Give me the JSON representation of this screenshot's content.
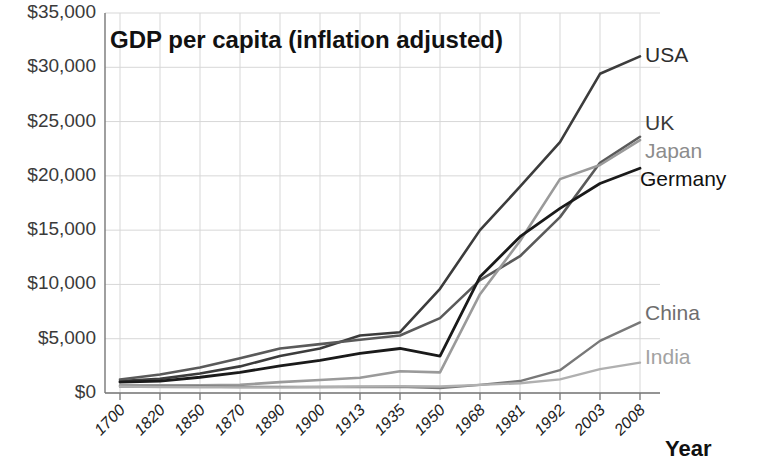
{
  "chart_data": {
    "type": "line",
    "title": "GDP per capita (inflation adjusted)",
    "xlabel": "Year",
    "ylabel": "",
    "grid": true,
    "legend_position": "right-inline-labels",
    "categories": [
      "1700",
      "1820",
      "1850",
      "1870",
      "1890",
      "1900",
      "1913",
      "1935",
      "1950",
      "1968",
      "1981",
      "1992",
      "2003",
      "2008"
    ],
    "ytick_labels": [
      "$35,000",
      "$30,000",
      "$25,000",
      "$20,000",
      "$15,000",
      "$10,000",
      "$5,000",
      "$0"
    ],
    "ytick_values": [
      35000,
      30000,
      25000,
      20000,
      15000,
      10000,
      5000,
      0
    ],
    "ylim": [
      0,
      35000
    ],
    "series": [
      {
        "name": "USA",
        "color": "#3c3c3c",
        "width": 2.6,
        "values": [
          1100,
          1300,
          1800,
          2450,
          3400,
          4100,
          5300,
          5600,
          9600,
          15000,
          19000,
          23100,
          29400,
          31000
        ]
      },
      {
        "name": "UK",
        "color": "#5a5a5a",
        "width": 2.6,
        "values": [
          1250,
          1700,
          2350,
          3200,
          4100,
          4500,
          4900,
          5300,
          6900,
          10400,
          12600,
          16200,
          21200,
          23600
        ]
      },
      {
        "name": "Japan",
        "color": "#9a9a9a",
        "width": 2.6,
        "values": [
          700,
          700,
          700,
          750,
          1000,
          1200,
          1400,
          2000,
          1900,
          9100,
          14000,
          19700,
          21000,
          23300
        ]
      },
      {
        "name": "Germany",
        "color": "#1a1a1a",
        "width": 2.8,
        "values": [
          1000,
          1100,
          1450,
          1900,
          2500,
          3000,
          3650,
          4100,
          3400,
          10700,
          14400,
          17000,
          19300,
          20700
        ]
      },
      {
        "name": "China",
        "color": "#787878",
        "width": 2.4,
        "values": [
          600,
          600,
          600,
          550,
          550,
          550,
          550,
          560,
          450,
          750,
          1100,
          2100,
          4800,
          6500
        ]
      },
      {
        "name": "India",
        "color": "#b0b0b0",
        "width": 2.4,
        "values": [
          600,
          550,
          530,
          520,
          520,
          550,
          600,
          620,
          600,
          750,
          900,
          1250,
          2200,
          2800
        ]
      }
    ],
    "series_labels": [
      {
        "text": "USA",
        "x": 645,
        "y": 62,
        "color": "#2d2d2d",
        "weight": "normal"
      },
      {
        "text": "UK",
        "x": 645,
        "y": 130,
        "color": "#3a3a3a",
        "weight": "normal"
      },
      {
        "text": "Japan",
        "x": 645,
        "y": 158,
        "color": "#8c8c8c",
        "weight": "normal"
      },
      {
        "text": "Germany",
        "x": 640,
        "y": 186,
        "color": "#111111",
        "weight": "normal"
      },
      {
        "text": "China",
        "x": 645,
        "y": 320,
        "color": "#6e6e6e",
        "weight": "normal"
      },
      {
        "text": "India",
        "x": 645,
        "y": 364,
        "color": "#a2a2a2",
        "weight": "normal"
      }
    ]
  },
  "axis_titles": {
    "x": "Year"
  }
}
